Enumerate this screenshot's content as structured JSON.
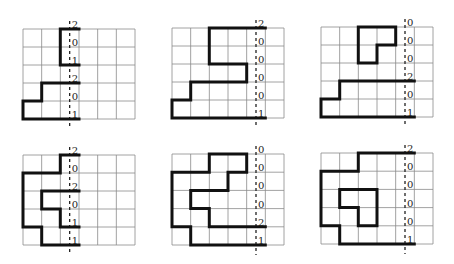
{
  "figure": {
    "cols": 6,
    "rows": 5,
    "panels": [
      {
        "id": "p1",
        "x": 23,
        "y": 29,
        "w": 112,
        "h": 90,
        "dash_col": 2.5,
        "labels": [
          "2",
          "0",
          "1",
          "2",
          "0",
          "1"
        ],
        "paths": [
          [
            [
              3,
              0
            ],
            [
              2,
              0
            ],
            [
              2,
              2
            ],
            [
              3,
              2
            ]
          ],
          [
            [
              3,
              3
            ],
            [
              1,
              3
            ],
            [
              1,
              4
            ],
            [
              0,
              4
            ],
            [
              0,
              5
            ],
            [
              3,
              5
            ]
          ]
        ]
      },
      {
        "id": "p2",
        "x": 172,
        "y": 28,
        "w": 112,
        "h": 90,
        "dash_col": 4.5,
        "labels": [
          "2",
          "0",
          "0",
          "0",
          "0",
          "1"
        ],
        "paths": [
          [
            [
              5,
              0
            ],
            [
              2,
              0
            ],
            [
              2,
              2
            ],
            [
              4,
              2
            ],
            [
              4,
              3
            ],
            [
              1,
              3
            ],
            [
              1,
              4
            ],
            [
              0,
              4
            ],
            [
              0,
              5
            ],
            [
              5,
              5
            ]
          ]
        ]
      },
      {
        "id": "p3",
        "x": 321,
        "y": 27,
        "w": 112,
        "h": 90,
        "dash_col": 4.5,
        "labels": [
          "0",
          "0",
          "0",
          "2",
          "0",
          "1"
        ],
        "paths": [
          [
            [
              2,
              0
            ],
            [
              4,
              0
            ],
            [
              4,
              1
            ],
            [
              3,
              1
            ],
            [
              3,
              2
            ],
            [
              2,
              2
            ],
            [
              2,
              0
            ]
          ],
          [
            [
              5,
              3
            ],
            [
              1,
              3
            ],
            [
              1,
              4
            ],
            [
              0,
              4
            ],
            [
              0,
              5
            ],
            [
              5,
              5
            ]
          ]
        ]
      },
      {
        "id": "p4",
        "x": 23,
        "y": 155,
        "w": 112,
        "h": 90,
        "dash_col": 2.5,
        "labels": [
          "2",
          "0",
          "2",
          "0",
          "1",
          "1"
        ],
        "paths": [
          [
            [
              3,
              0
            ],
            [
              2,
              0
            ],
            [
              2,
              1
            ],
            [
              0,
              1
            ],
            [
              0,
              4
            ],
            [
              1,
              4
            ],
            [
              1,
              5
            ],
            [
              3,
              5
            ]
          ],
          [
            [
              3,
              2
            ],
            [
              1,
              2
            ],
            [
              1,
              3
            ],
            [
              2,
              3
            ],
            [
              2,
              4
            ],
            [
              3,
              4
            ]
          ]
        ]
      },
      {
        "id": "p5",
        "x": 172,
        "y": 154,
        "w": 112,
        "h": 91,
        "dash_col": 4.5,
        "labels": [
          "0",
          "0",
          "0",
          "0",
          "2",
          "1"
        ],
        "paths": [
          [
            [
              5,
              4
            ],
            [
              2,
              4
            ],
            [
              2,
              3
            ],
            [
              1,
              3
            ],
            [
              1,
              2
            ],
            [
              3,
              2
            ],
            [
              3,
              1
            ],
            [
              4,
              1
            ],
            [
              4,
              0
            ],
            [
              2,
              0
            ],
            [
              2,
              1
            ],
            [
              0,
              1
            ],
            [
              0,
              4
            ],
            [
              1,
              4
            ],
            [
              1,
              5
            ],
            [
              5,
              5
            ]
          ]
        ]
      },
      {
        "id": "p6",
        "x": 321,
        "y": 153,
        "w": 112,
        "h": 91,
        "dash_col": 4.5,
        "labels": [
          "2",
          "0",
          "0",
          "0",
          "0",
          "1"
        ],
        "paths": [
          [
            [
              5,
              0
            ],
            [
              2,
              0
            ],
            [
              2,
              1
            ],
            [
              0,
              1
            ],
            [
              0,
              4
            ],
            [
              1,
              4
            ],
            [
              1,
              5
            ],
            [
              5,
              5
            ]
          ],
          [
            [
              1,
              2
            ],
            [
              3,
              2
            ],
            [
              3,
              4
            ],
            [
              2,
              4
            ],
            [
              2,
              3
            ],
            [
              1,
              3
            ],
            [
              1,
              2
            ]
          ]
        ]
      }
    ]
  }
}
